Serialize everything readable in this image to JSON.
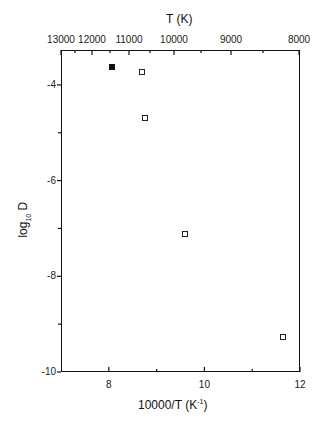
{
  "chart_data": {
    "type": "scatter",
    "title": "",
    "xlabel": "10000/T (K-1)",
    "xlabel_main": "10000/T (K",
    "xlabel_sup": "-1",
    "xlabel_tail": ")",
    "ylabel": "log10 D",
    "ylabel_main": "log",
    "ylabel_sub": "10",
    "ylabel_tail": " D",
    "top_axis_label": "T (K)",
    "xlim": [
      7,
      12
    ],
    "ylim": [
      -10,
      -3.27
    ],
    "grid": false,
    "x_ticks": [
      {
        "value": 8,
        "label": "8"
      },
      {
        "value": 10,
        "label": "10"
      },
      {
        "value": 12,
        "label": "12"
      }
    ],
    "x_minor_ticks": [
      9,
      11
    ],
    "y_ticks": [
      {
        "value": -4,
        "label": "-4"
      },
      {
        "value": -6,
        "label": "-6"
      },
      {
        "value": -8,
        "label": "-8"
      },
      {
        "value": -10,
        "label": "-10"
      }
    ],
    "y_minor_ticks": [
      -5,
      -7,
      -9
    ],
    "top_ticks": [
      {
        "label": "13000",
        "px": 61
      },
      {
        "label": "12000",
        "px": 92
      },
      {
        "label": "11000",
        "px": 129
      },
      {
        "label": "10000",
        "px": 174
      },
      {
        "label": "9000",
        "px": 231
      },
      {
        "label": "8000",
        "px": 299
      }
    ],
    "top_minor_px": [
      75,
      110,
      150,
      201,
      263
    ],
    "series": [
      {
        "name": "filled",
        "marker": "filled-square",
        "points": [
          {
            "x": 8.06,
            "y": -3.62
          }
        ]
      },
      {
        "name": "open",
        "marker": "open-square",
        "points": [
          {
            "x": 8.69,
            "y": -3.73
          },
          {
            "x": 8.75,
            "y": -4.69
          },
          {
            "x": 9.6,
            "y": -7.12
          },
          {
            "x": 11.65,
            "y": -9.27
          }
        ]
      }
    ]
  }
}
